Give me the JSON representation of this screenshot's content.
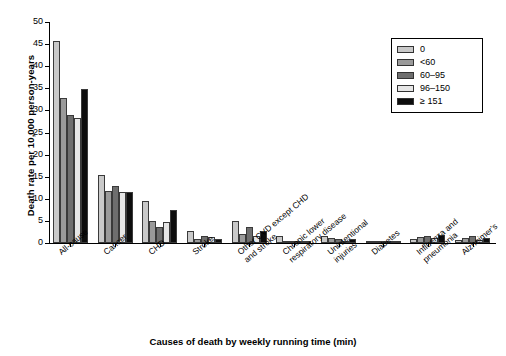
{
  "chart_data": {
    "type": "bar",
    "title": "",
    "xlabel": "Causes of death by weekly running time (min)",
    "ylabel": "Death rate per 10,000 person-years",
    "ylim": [
      0,
      50
    ],
    "yticks": [
      0,
      5,
      10,
      15,
      20,
      25,
      30,
      35,
      40,
      45,
      50
    ],
    "grid": false,
    "legend_position": "top-right",
    "legend_title": "",
    "categories": [
      "All-cause",
      "Cancer",
      "CHD",
      "Stroke",
      "Other CVD except CHD\nand stroke",
      "Chronic lower\nrespiratory disease",
      "Unintentional\ninjuries",
      "Diabetes",
      "Influenza and\npneumonia",
      "Alzheimer's"
    ],
    "series": [
      {
        "name": "0",
        "color": "#c9c9c9",
        "values": [
          45.8,
          15.5,
          9.6,
          2.8,
          5.0,
          1.5,
          1.7,
          0.5,
          0.9,
          0.6
        ]
      },
      {
        "name": "<60",
        "color": "#9a9a9a",
        "values": [
          32.8,
          11.7,
          5.0,
          1.0,
          2.0,
          0.4,
          1.1,
          0.2,
          1.4,
          1.1
        ]
      },
      {
        "name": "60–95",
        "color": "#6e6e6e",
        "values": [
          29.0,
          12.9,
          3.6,
          1.6,
          3.7,
          0.3,
          0.9,
          0.2,
          1.6,
          1.5
        ]
      },
      {
        "name": "96–150",
        "color": "#e6e6e6",
        "values": [
          28.3,
          11.6,
          4.7,
          1.4,
          1.5,
          0.3,
          0.5,
          0.2,
          1.2,
          0.7
        ]
      },
      {
        "name": "≥ 151",
        "color": "#0d0d0d",
        "values": [
          34.9,
          11.5,
          7.5,
          1.0,
          2.7,
          0.3,
          0.8,
          0.2,
          1.9,
          1.1
        ]
      }
    ]
  },
  "legend": {
    "items": [
      {
        "label": "0"
      },
      {
        "label": "<60"
      },
      {
        "label": "60–95"
      },
      {
        "label": "96–150"
      },
      {
        "label": "≥ 151"
      }
    ]
  }
}
